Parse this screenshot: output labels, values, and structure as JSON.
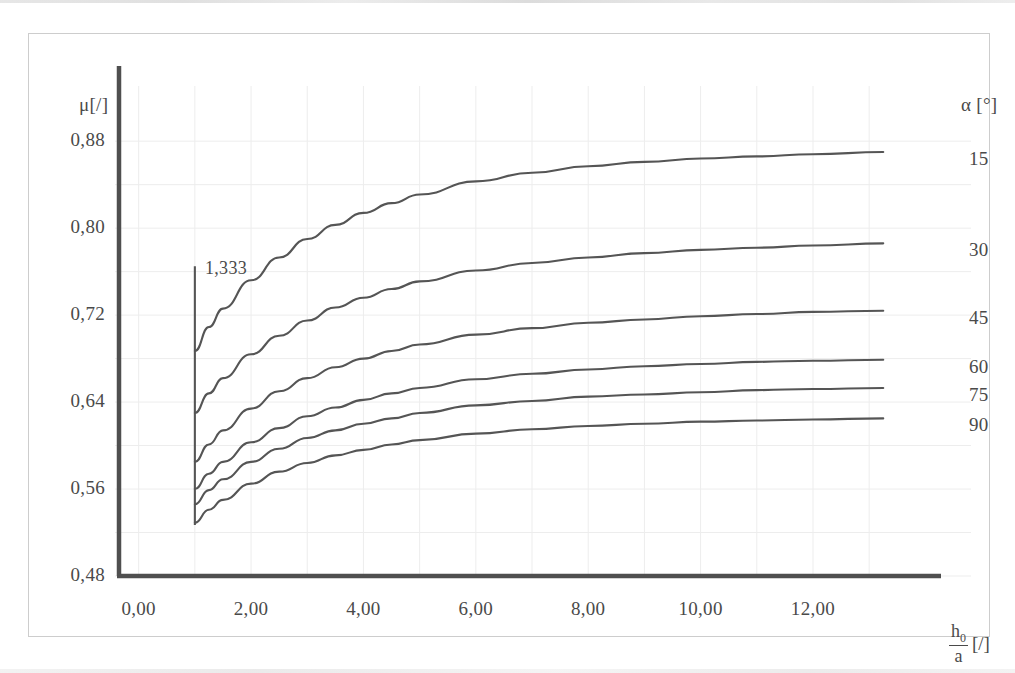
{
  "figure": {
    "y_axis_title": "μ[/]",
    "alpha_axis_title": "α [°]",
    "x_axis_title_num": "h",
    "x_axis_title_num_sub": "0",
    "x_axis_title_den": "a",
    "x_axis_title_unit": "[/]",
    "annotation_vertical": "1,333"
  },
  "chart_data": {
    "type": "line",
    "title": "",
    "xlabel": "h0/a [/]",
    "ylabel": "μ [/]",
    "xlim": [
      -0.35,
      14.1
    ],
    "ylim": [
      0.48,
      0.905
    ],
    "xticks": [
      "0,00",
      "2,00",
      "4,00",
      "6,00",
      "8,00",
      "10,00",
      "12,00"
    ],
    "xtick_values": [
      0,
      2,
      4,
      6,
      8,
      10,
      12
    ],
    "yticks": [
      "0,88",
      "0,80",
      "0,72",
      "0,64",
      "0,56",
      "0,48"
    ],
    "ytick_values": [
      0.88,
      0.8,
      0.72,
      0.64,
      0.56,
      0.48
    ],
    "grid": true,
    "legend_position": "right-axis",
    "legend_title": "α [°]",
    "annotations": [
      {
        "text": "1,333",
        "x": 1.0,
        "y_top": 0.765,
        "y_bottom": 0.527,
        "type": "vertical-line-label"
      }
    ],
    "series": [
      {
        "name": "15",
        "label": "15",
        "x": [
          1.0,
          1.25,
          1.5,
          2.0,
          2.5,
          3.0,
          3.5,
          4.0,
          4.5,
          5.0,
          6.0,
          7.0,
          8.0,
          9.0,
          10.0,
          11.0,
          12.0,
          13.25
        ],
        "values": [
          0.687,
          0.709,
          0.726,
          0.752,
          0.773,
          0.79,
          0.803,
          0.814,
          0.823,
          0.831,
          0.843,
          0.851,
          0.857,
          0.861,
          0.864,
          0.866,
          0.868,
          0.87
        ]
      },
      {
        "name": "30",
        "label": "30",
        "x": [
          1.0,
          1.25,
          1.5,
          2.0,
          2.5,
          3.0,
          3.5,
          4.0,
          4.5,
          5.0,
          6.0,
          7.0,
          8.0,
          9.0,
          10.0,
          11.0,
          12.0,
          13.25
        ],
        "values": [
          0.63,
          0.648,
          0.662,
          0.684,
          0.701,
          0.715,
          0.727,
          0.736,
          0.744,
          0.751,
          0.761,
          0.768,
          0.773,
          0.777,
          0.78,
          0.782,
          0.784,
          0.786
        ]
      },
      {
        "name": "45",
        "label": "45",
        "x": [
          1.0,
          1.25,
          1.5,
          2.0,
          2.5,
          3.0,
          3.5,
          4.0,
          4.5,
          5.0,
          6.0,
          7.0,
          8.0,
          9.0,
          10.0,
          11.0,
          12.0,
          13.25
        ],
        "values": [
          0.585,
          0.601,
          0.614,
          0.634,
          0.65,
          0.662,
          0.672,
          0.68,
          0.687,
          0.693,
          0.702,
          0.708,
          0.713,
          0.716,
          0.719,
          0.721,
          0.723,
          0.724
        ]
      },
      {
        "name": "60",
        "label": "60",
        "x": [
          1.0,
          1.25,
          1.5,
          2.0,
          2.5,
          3.0,
          3.5,
          4.0,
          4.5,
          5.0,
          6.0,
          7.0,
          8.0,
          9.0,
          10.0,
          11.0,
          12.0,
          13.25
        ],
        "values": [
          0.56,
          0.574,
          0.585,
          0.603,
          0.616,
          0.627,
          0.635,
          0.642,
          0.648,
          0.653,
          0.661,
          0.666,
          0.67,
          0.673,
          0.675,
          0.677,
          0.678,
          0.679
        ]
      },
      {
        "name": "75",
        "label": "75",
        "x": [
          1.0,
          1.25,
          1.5,
          2.0,
          2.5,
          3.0,
          3.5,
          4.0,
          4.5,
          5.0,
          6.0,
          7.0,
          8.0,
          9.0,
          10.0,
          11.0,
          12.0,
          13.25
        ],
        "values": [
          0.546,
          0.559,
          0.569,
          0.585,
          0.597,
          0.607,
          0.614,
          0.62,
          0.625,
          0.63,
          0.637,
          0.641,
          0.645,
          0.647,
          0.649,
          0.651,
          0.652,
          0.653
        ]
      },
      {
        "name": "90",
        "label": "90",
        "x": [
          1.0,
          1.25,
          1.5,
          2.0,
          2.5,
          3.0,
          3.5,
          4.0,
          4.5,
          5.0,
          6.0,
          7.0,
          8.0,
          9.0,
          10.0,
          11.0,
          12.0,
          13.25
        ],
        "values": [
          0.529,
          0.541,
          0.55,
          0.565,
          0.576,
          0.584,
          0.591,
          0.596,
          0.601,
          0.605,
          0.611,
          0.615,
          0.618,
          0.62,
          0.622,
          0.623,
          0.624,
          0.625
        ]
      }
    ],
    "colors": {
      "curve": "#555555",
      "axis": "#4f4f4f",
      "grid": "#ededed",
      "text": "#4a4a4a",
      "frame": "#cdcdcd"
    }
  }
}
